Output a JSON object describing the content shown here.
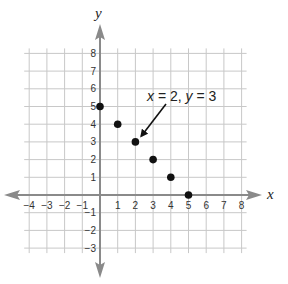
{
  "chart_data": {
    "type": "scatter",
    "title": "",
    "xlabel": "x",
    "ylabel": "y",
    "xlim": [
      -4,
      8
    ],
    "ylim": [
      -3,
      8
    ],
    "grid": true,
    "x_ticks": [
      -4,
      -3,
      -2,
      -1,
      1,
      2,
      3,
      4,
      5,
      6,
      7,
      8
    ],
    "y_ticks": [
      -3,
      -2,
      -1,
      1,
      2,
      3,
      4,
      5,
      6,
      7,
      8
    ],
    "x_tick_labels": [
      "−4",
      "−3",
      "−2",
      "−1",
      "1",
      "2",
      "3",
      "4",
      "5",
      "6",
      "7",
      "8"
    ],
    "y_tick_labels": [
      "−3",
      "−2",
      "−1",
      "1",
      "2",
      "3",
      "4",
      "5",
      "6",
      "7",
      "8"
    ],
    "series": [
      {
        "name": "points",
        "x": [
          0,
          1,
          2,
          3,
          4,
          5
        ],
        "y": [
          5,
          4,
          3,
          2,
          1,
          0
        ]
      }
    ],
    "annotations": [
      {
        "text": "x = 2, y = 3",
        "parts": [
          "x",
          " = 2, ",
          "y",
          " = 3"
        ],
        "points_to": [
          2,
          3
        ]
      }
    ]
  },
  "colors": {
    "grid": "#c8c8c8",
    "axis": "#8a8a8a",
    "point": "#111111",
    "text": "#222222"
  }
}
